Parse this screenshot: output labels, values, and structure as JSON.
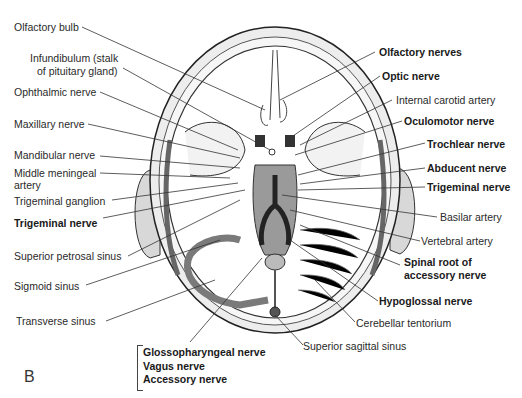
{
  "figure": {
    "panel_letter": "B"
  },
  "labels_left": [
    {
      "text": "Olfactory bulb",
      "bold": false
    },
    {
      "text": "Infundibulum (stalk",
      "bold": false
    },
    {
      "text": "of pituitary gland)",
      "bold": false
    },
    {
      "text": "Ophthalmic nerve",
      "bold": false
    },
    {
      "text": "Maxillary nerve",
      "bold": false
    },
    {
      "text": "Mandibular nerve",
      "bold": false
    },
    {
      "text": "Middle meningeal",
      "bold": false
    },
    {
      "text": "artery",
      "bold": false
    },
    {
      "text": "Trigeminal ganglion",
      "bold": false
    },
    {
      "text": "Trigeminal nerve",
      "bold": true
    },
    {
      "text": "Superior petrosal sinus",
      "bold": false
    },
    {
      "text": "Sigmoid sinus",
      "bold": false
    },
    {
      "text": "Transverse sinus",
      "bold": false
    }
  ],
  "labels_right": [
    {
      "text": "Olfactory nerves",
      "bold": true
    },
    {
      "text": "Optic nerve",
      "bold": true
    },
    {
      "text": "Internal carotid artery",
      "bold": false
    },
    {
      "text": "Oculomotor nerve",
      "bold": true
    },
    {
      "text": "Trochlear nerve",
      "bold": true
    },
    {
      "text": "Abducent nerve",
      "bold": true
    },
    {
      "text": "Trigeminal nerve",
      "bold": true
    },
    {
      "text": "Basilar artery",
      "bold": false
    },
    {
      "text": "Vertebral artery",
      "bold": false
    },
    {
      "text": "Spinal root of",
      "bold": true
    },
    {
      "text": "accessory nerve",
      "bold": true
    },
    {
      "text": "Hypoglossal nerve",
      "bold": true
    },
    {
      "text": "Cerebellar tentorium",
      "bold": false
    },
    {
      "text": "Superior sagittal sinus",
      "bold": false
    }
  ],
  "bracket_group": [
    "Glossopharyngeal nerve",
    "Vagus nerve",
    "Accessory nerve"
  ],
  "colors": {
    "line": "#333333",
    "bone_fill": "#efefef",
    "dura_fill": "#d9d9d9",
    "sinus_fill": "#7a7a7a",
    "brainstem_fill": "#8c8c8c"
  }
}
